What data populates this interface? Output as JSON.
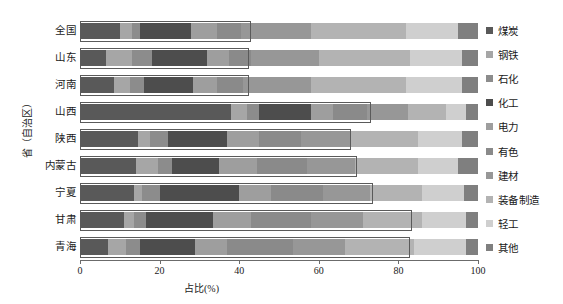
{
  "chart_data": {
    "type": "bar",
    "orientation": "horizontal",
    "stacked": true,
    "normalized": true,
    "title": "",
    "xlabel": "占比(%)",
    "ylabel": "省（自治区）",
    "xlim": [
      0,
      100
    ],
    "xticks": [
      0,
      20,
      40,
      60,
      80,
      100
    ],
    "xticklabels": [
      "0",
      "20",
      "40",
      "60",
      "80",
      "100"
    ],
    "grid": false,
    "legend_position": "right",
    "categories": [
      "全国",
      "山东",
      "河南",
      "山西",
      "陕西",
      "内蒙古",
      "宁夏",
      "甘肃",
      "青海"
    ],
    "series": [
      {
        "name": "煤炭",
        "color": "#595959",
        "values": [
          10.0,
          6.5,
          8.5,
          38.0,
          14.5,
          14.0,
          13.5,
          11.0,
          7.0
        ]
      },
      {
        "name": "钢铁",
        "color": "#a6a6a6",
        "values": [
          3.0,
          6.5,
          4.0,
          4.0,
          3.0,
          5.5,
          2.0,
          2.5,
          4.5
        ]
      },
      {
        "name": "石化",
        "color": "#8c8c8c",
        "values": [
          2.0,
          5.0,
          3.5,
          3.0,
          4.5,
          3.5,
          4.5,
          3.0,
          3.5
        ]
      },
      {
        "name": "化工",
        "color": "#4d4d4d",
        "values": [
          13.0,
          14.0,
          12.5,
          13.0,
          15.0,
          12.0,
          20.0,
          17.0,
          14.0
        ]
      },
      {
        "name": "电力",
        "color": "#9e9e9e",
        "values": [
          6.5,
          5.5,
          6.0,
          5.5,
          8.0,
          9.5,
          8.0,
          9.5,
          8.0
        ]
      },
      {
        "name": "有色",
        "color": "#8a8a8a",
        "values": [
          6.0,
          5.5,
          6.5,
          8.5,
          10.5,
          12.5,
          13.0,
          15.0,
          16.5
        ]
      },
      {
        "name": "建材",
        "color": "#979797",
        "values": [
          17.5,
          17.0,
          17.0,
          10.5,
          12.5,
          12.0,
          12.0,
          13.0,
          13.0
        ]
      },
      {
        "name": "装备制造",
        "color": "#b3b3b3",
        "values": [
          24.0,
          23.0,
          24.0,
          9.5,
          17.0,
          16.0,
          13.0,
          15.0,
          17.5
        ]
      },
      {
        "name": "轻工",
        "color": "#cfcfcf",
        "values": [
          13.0,
          13.0,
          14.0,
          5.0,
          11.0,
          10.0,
          10.5,
          11.0,
          13.0
        ]
      },
      {
        "name": "其他",
        "color": "#7f7f7f",
        "values": [
          5.0,
          4.0,
          4.0,
          3.0,
          4.0,
          5.0,
          3.5,
          3.0,
          3.0
        ]
      }
    ],
    "annotations": [
      {
        "row": 0,
        "x_start": 0.0,
        "x_end": 42.5,
        "label": "highlight-box-national"
      },
      {
        "row": 1,
        "x_start": 0.0,
        "x_end": 42.0,
        "label": "highlight-box-shandong"
      },
      {
        "row": 2,
        "x_start": 0.0,
        "x_end": 42.0,
        "label": "highlight-box-henan"
      },
      {
        "row": 3,
        "x_start": 0.0,
        "x_end": 72.5,
        "label": "highlight-box-shanxi"
      },
      {
        "row": 4,
        "x_start": 0.0,
        "x_end": 67.5,
        "label": "highlight-box-shaanxi"
      },
      {
        "row": 5,
        "x_start": 0.0,
        "x_end": 69.0,
        "label": "highlight-box-neimenggu"
      },
      {
        "row": 6,
        "x_start": 0.0,
        "x_end": 73.0,
        "label": "highlight-box-ningxia"
      },
      {
        "row": 7,
        "x_start": 0.0,
        "x_end": 83.0,
        "label": "highlight-box-gansu"
      },
      {
        "row": 8,
        "x_start": 0.0,
        "x_end": 82.5,
        "label": "highlight-box-qinghai"
      }
    ]
  },
  "axes": {
    "y_title": "省（自治区）",
    "x_title": "占比(%)"
  }
}
